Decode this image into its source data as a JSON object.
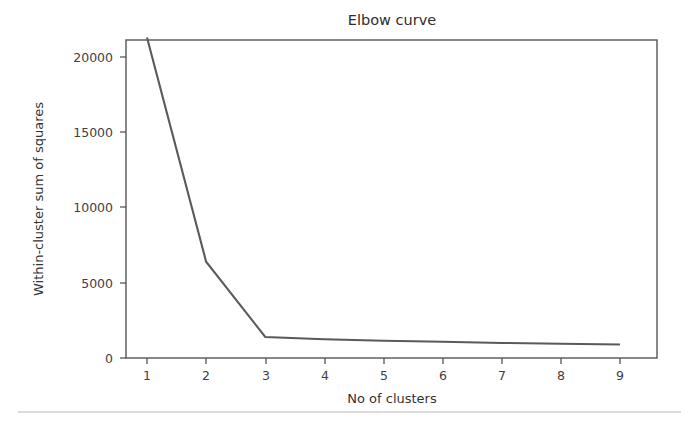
{
  "figure": {
    "background_color": "#ffffff",
    "line_color": "#5a5a5a",
    "axis_color": "#555555",
    "text_color": "#333333",
    "footer_rule_color": "#b8b8b8"
  },
  "chart_data": {
    "type": "line",
    "title": "Elbow curve",
    "xlabel": "No of clusters",
    "ylabel": "Within-cluster sum  of squares",
    "x": [
      1,
      2,
      3,
      4,
      5,
      6,
      7,
      8,
      9
    ],
    "values": [
      21300,
      6400,
      1400,
      1250,
      1150,
      1080,
      1000,
      950,
      900
    ],
    "series": [
      {
        "name": "Within-cluster sum of squares",
        "values": [
          21300,
          6400,
          1400,
          1250,
          1150,
          1080,
          1000,
          950,
          900
        ]
      }
    ],
    "xticks": [
      1,
      2,
      3,
      4,
      5,
      6,
      7,
      8,
      9
    ],
    "xtick_labels": [
      "1",
      "2",
      "3",
      "4",
      "5",
      "6",
      "7",
      "8",
      "9"
    ],
    "yticks": [
      0,
      5000,
      10000,
      15000,
      20000
    ],
    "ytick_labels": [
      "0",
      "5000",
      "10000",
      "15000",
      "20000"
    ],
    "xlim": [
      0.6,
      9.5
    ],
    "ylim": [
      -700,
      22300
    ],
    "grid": false,
    "legend": false,
    "legend_position": "none"
  },
  "axis": {
    "y_tick_labels": [
      "20000",
      "15000",
      "10000",
      "5000",
      "0"
    ],
    "x_tick_labels": [
      "1",
      "2",
      "3",
      "4",
      "5",
      "6",
      "7",
      "8",
      "9"
    ],
    "x_title": "No of clusters",
    "y_title": "Within-cluster sum  of squares"
  },
  "title": {
    "text": "Elbow curve"
  }
}
